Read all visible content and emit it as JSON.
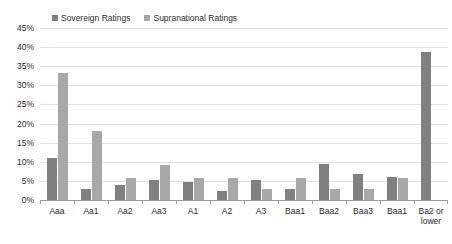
{
  "chart_data": {
    "type": "bar",
    "title": "",
    "xlabel": "",
    "ylabel": "",
    "ylim": [
      0,
      45
    ],
    "ytick_labels": [
      "45%",
      "40%",
      "35%",
      "30%",
      "25%",
      "20%",
      "15%",
      "10%",
      "5%",
      "0%"
    ],
    "ytick_values": [
      45,
      40,
      35,
      30,
      25,
      20,
      15,
      10,
      5,
      0
    ],
    "grid": true,
    "legend_position": "top-left",
    "categories": [
      "Aaa",
      "Aa1",
      "Aa2",
      "Aa3",
      "A1",
      "A2",
      "A3",
      "Baa1",
      "Baa2",
      "Baa3",
      "Baa1",
      "Ba2 or\nlower"
    ],
    "series": [
      {
        "name": "Sovereign Ratings",
        "color": "#808080",
        "values": [
          11.0,
          3.0,
          3.9,
          5.3,
          4.7,
          2.3,
          5.3,
          3.0,
          9.3,
          6.9,
          6.0,
          38.8
        ]
      },
      {
        "name": "Supranational Ratings",
        "color": "#a8a8a8",
        "values": [
          33.2,
          18.1,
          5.8,
          9.1,
          5.8,
          5.8,
          2.9,
          5.8,
          2.9,
          2.9,
          5.8,
          0.0
        ]
      }
    ]
  },
  "colors": {
    "sovereign": "#808080",
    "supranational": "#a8a8a8",
    "gridline": "#e2e2e2",
    "axis": "#9a9a9a",
    "text": "#2b2b2b",
    "background": "#ffffff"
  }
}
